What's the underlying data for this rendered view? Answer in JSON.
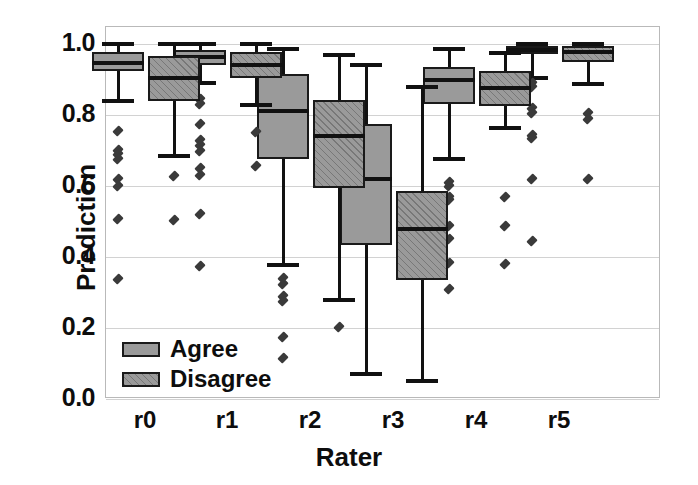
{
  "chart_data": {
    "type": "box",
    "title": "",
    "xlabel": "Rater",
    "ylabel": "Prediction",
    "categories": [
      "r0",
      "r1",
      "r2",
      "r3",
      "r4",
      "r5"
    ],
    "ylim": [
      0.0,
      1.0
    ],
    "yticks": [
      "0.0",
      "0.2",
      "0.4",
      "0.6",
      "0.8",
      "1.0"
    ],
    "ytick_values": [
      0.0,
      0.2,
      0.4,
      0.6,
      0.8,
      1.0
    ],
    "grid": true,
    "legend": {
      "position": "lower left",
      "entries": [
        {
          "label": "Agree",
          "style": "solid-gray"
        },
        {
          "label": "Disagree",
          "style": "hatched-gray"
        }
      ]
    },
    "series": [
      {
        "name": "Agree",
        "boxes": [
          {
            "category": "r0",
            "whisker_low": 0.84,
            "q1": 0.924,
            "median": 0.947,
            "q3": 0.978,
            "whisker_high": 1.0,
            "fliers": [
              0.755,
              0.702,
              0.69,
              0.675,
              0.62,
              0.6,
              0.507,
              0.338
            ]
          },
          {
            "category": "r1",
            "whisker_low": 0.89,
            "q1": 0.94,
            "median": 0.962,
            "q3": 0.983,
            "whisker_high": 1.0,
            "fliers": [
              0.845,
              0.83,
              0.775,
              0.73,
              0.715,
              0.7,
              0.65,
              0.63,
              0.52,
              0.375
            ]
          },
          {
            "category": "r2",
            "whisker_low": 0.378,
            "q1": 0.675,
            "median": 0.81,
            "q3": 0.915,
            "whisker_high": 0.985,
            "fliers": [
              0.34,
              0.325,
              0.29,
              0.275,
              0.175,
              0.115
            ]
          },
          {
            "category": "r3",
            "whisker_low": 0.07,
            "q1": 0.435,
            "median": 0.62,
            "q3": 0.775,
            "whisker_high": 0.94
          },
          {
            "category": "r4",
            "whisker_low": 0.675,
            "q1": 0.83,
            "median": 0.898,
            "q3": 0.935,
            "whisker_high": 0.985,
            "fliers": [
              0.612,
              0.6,
              0.57,
              0.56,
              0.487,
              0.45,
              0.383,
              0.31
            ]
          },
          {
            "category": "r5",
            "whisker_low": 0.905,
            "q1": 0.972,
            "median": 0.982,
            "q3": 0.993,
            "whisker_high": 1.0,
            "fliers": [
              0.89,
              0.88,
              0.82,
              0.805,
              0.745,
              0.735,
              0.62,
              0.445
            ]
          }
        ]
      },
      {
        "name": "Disagree",
        "boxes": [
          {
            "category": "r0",
            "whisker_low": 0.685,
            "q1": 0.84,
            "median": 0.905,
            "q3": 0.965,
            "whisker_high": 1.0,
            "fliers": [
              0.628,
              0.505
            ]
          },
          {
            "category": "r1",
            "whisker_low": 0.828,
            "q1": 0.905,
            "median": 0.942,
            "q3": 0.978,
            "whisker_high": 1.0,
            "fliers": [
              0.752,
              0.655
            ]
          },
          {
            "category": "r2",
            "whisker_low": 0.28,
            "q1": 0.595,
            "median": 0.74,
            "q3": 0.843,
            "whisker_high": 0.968,
            "fliers": [
              0.202
            ]
          },
          {
            "category": "r3",
            "whisker_low": 0.05,
            "q1": 0.335,
            "median": 0.478,
            "q3": 0.585,
            "whisker_high": 0.88
          },
          {
            "category": "r4",
            "whisker_low": 0.762,
            "q1": 0.825,
            "median": 0.875,
            "q3": 0.925,
            "whisker_high": 0.975,
            "fliers": [
              0.57,
              0.487,
              0.38
            ]
          },
          {
            "category": "r5",
            "whisker_low": 0.888,
            "q1": 0.95,
            "median": 0.978,
            "q3": 0.995,
            "whisker_high": 1.0,
            "fliers": [
              0.805,
              0.79,
              0.62
            ]
          }
        ]
      }
    ]
  },
  "colors": {
    "box_fill": "#9a9a9a",
    "box_edge": "#1a1a1a",
    "median": "#111111",
    "grid": "#d2d2d2",
    "frame": "#b9b9b9",
    "text": "#0d0d0d"
  }
}
